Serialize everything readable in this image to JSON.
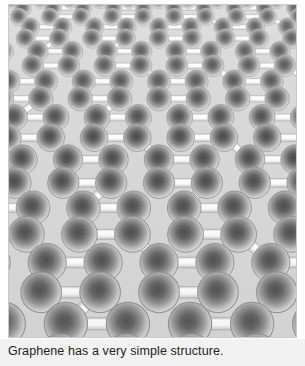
{
  "figure": {
    "title_alt": "Graphene honeycomb lattice in perspective",
    "frame": {
      "x": 8,
      "y": 4,
      "width": 289,
      "height": 334
    },
    "background_color": "#d7d7d7",
    "frame_border_color": "#c9c9c9",
    "atom": {
      "label": "carbon-atom",
      "center_color": "#4a4a4a",
      "mid_color": "#9a9a9a",
      "edge_color": "#e8e8e8",
      "outline_color": "#8d8d8d",
      "count_visible": 120
    },
    "bond": {
      "label": "carbon-carbon-bond",
      "fill_color": "#fbfbfb",
      "highlight_color": "#ffffff",
      "shade_color": "#cfcfcf",
      "outline_color": "#9a9a9a"
    },
    "perspective": {
      "rows": 13,
      "cols": 9,
      "horizon_y": -34,
      "near_row_spacing": 52,
      "far_row_spacing": 7,
      "near_atom_radius": 23,
      "far_atom_radius": 5.5,
      "near_bond_width": 13,
      "far_bond_width": 2.6,
      "near_half_width": 360,
      "far_half_width": 150,
      "center_x": 150
    }
  },
  "caption": {
    "text": "Graphene has a very simple structure.",
    "color": "#231f20"
  }
}
